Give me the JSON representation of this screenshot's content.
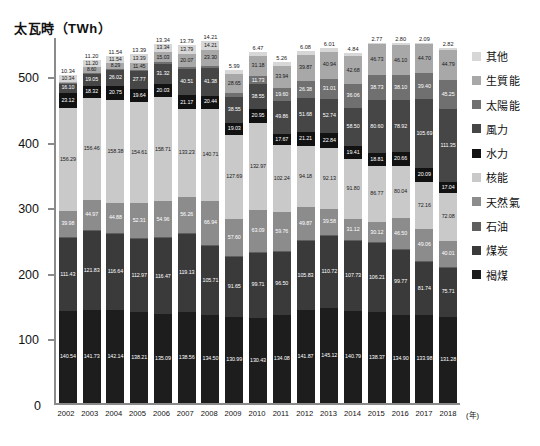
{
  "chart_data": {
    "type": "bar",
    "stacked": true,
    "title": "",
    "ylabel": "太瓦時（TWh）",
    "xlabel": "(年)",
    "ylim": [
      0,
      560
    ],
    "yticks": [
      0,
      100,
      200,
      300,
      400,
      500
    ],
    "ytick_labels": [
      "0",
      "100",
      "200",
      "300",
      "400",
      "500"
    ],
    "grid": false,
    "legend_position": "right",
    "categories": [
      "2002",
      "2003",
      "2004",
      "2005",
      "2006",
      "2007",
      "2008",
      "2009",
      "2010",
      "2011",
      "2012",
      "2013",
      "2014",
      "2015",
      "2016",
      "2017",
      "2018"
    ],
    "stack_order_bottom_to_top": [
      "褐煤",
      "煤炭",
      "石油",
      "天然氣",
      "核能",
      "水力",
      "風力",
      "太陽能",
      "生質能",
      "其他"
    ],
    "series": [
      {
        "name": "褐煤",
        "color": "#1d1d1d",
        "values": [
          140.54,
          141.73,
          142.14,
          138.21,
          135.09,
          138.56,
          134.5,
          130.99,
          130.43,
          134.08,
          141.87,
          145.12,
          140.79,
          138.37,
          134.9,
          133.98,
          131.28
        ]
      },
      {
        "name": "煤炭",
        "color": "#3a3a3a",
        "values": [
          111.43,
          121.83,
          116.64,
          112.97,
          116.47,
          119.13,
          105.71,
          91.65,
          99.71,
          96.5,
          105.83,
          110.72,
          107.73,
          106.21,
          99.77,
          81.74,
          75.71
        ]
      },
      {
        "name": "石油",
        "color": "#5f5f5f",
        "values": [
          1.32,
          1.15,
          0.91,
          1.27,
          1.24,
          1.03,
          0.99,
          1.01,
          1.05,
          0.99,
          0.99,
          0.97,
          0.9,
          0.95,
          0.91,
          0.91,
          1.0
        ]
      },
      {
        "name": "天然氣",
        "color": "#8c8c8c",
        "values": [
          39.98,
          44.97,
          44.88,
          52.31,
          54.96,
          56.26,
          66.94,
          57.6,
          63.09,
          59.76,
          49.87,
          39.58,
          31.12,
          30.12,
          46.5,
          49.06,
          40.01
        ]
      },
      {
        "name": "核能",
        "color": "#c9c9c9",
        "values": [
          156.29,
          156.46,
          158.38,
          154.61,
          158.71,
          133.23,
          140.71,
          127.69,
          132.97,
          102.24,
          94.18,
          92.13,
          91.8,
          86.77,
          80.04,
          72.16,
          72.08
        ]
      },
      {
        "name": "水力",
        "color": "#121212",
        "values": [
          23.12,
          18.32,
          20.75,
          19.64,
          20.03,
          21.17,
          20.44,
          19.03,
          20.95,
          17.67,
          21.21,
          22.84,
          19.41,
          18.81,
          20.66,
          20.09,
          17.04
        ]
      },
      {
        "name": "風力",
        "color": "#464646",
        "values": [
          16.1,
          19.05,
          26.02,
          27.77,
          31.32,
          40.51,
          41.38,
          38.55,
          38.55,
          49.86,
          51.68,
          52.74,
          58.5,
          80.6,
          78.92,
          105.69,
          111.35
        ]
      },
      {
        "name": "太陽能",
        "color": "#707070",
        "values": [
          0.16,
          0.51,
          0.56,
          1.28,
          2.22,
          3.08,
          4.42,
          6.58,
          11.73,
          19.6,
          26.38,
          31.01,
          36.06,
          38.73,
          38.1,
          39.4,
          45.25
        ]
      },
      {
        "name": "生質能",
        "color": "#a8a8a8",
        "values": [
          1.08,
          8.6,
          8.29,
          11.45,
          15.03,
          20.07,
          23.3,
          28.65,
          31.18,
          33.94,
          39.87,
          40.94,
          42.68,
          46.73,
          46.1,
          44.7,
          44.79
        ]
      },
      {
        "name": "其他",
        "color": "#d7d7d7",
        "values": [
          10.34,
          11.2,
          11.54,
          13.39,
          13.34,
          13.79,
          14.21,
          5.99,
          6.47,
          5.26,
          6.08,
          6.01,
          4.84,
          2.77,
          2.8,
          2.09,
          2.82
        ]
      }
    ],
    "total_labels": [
      "10.34",
      "11.20",
      "11.54",
      "13.39",
      "13.34",
      "13.79",
      "14.21",
      "5.99",
      "6.47",
      "5.26",
      "6.08",
      "6.01",
      "4.84",
      "2.77",
      "2.80",
      "2.09",
      "2.82"
    ]
  },
  "legend": {
    "items": [
      {
        "label": "其他",
        "color": "#d7d7d7"
      },
      {
        "label": "生質能",
        "color": "#a8a8a8"
      },
      {
        "label": "太陽能",
        "color": "#707070"
      },
      {
        "label": "風力",
        "color": "#464646"
      },
      {
        "label": "水力",
        "color": "#121212"
      },
      {
        "label": "核能",
        "color": "#c9c9c9"
      },
      {
        "label": "天然氣",
        "color": "#8c8c8c"
      },
      {
        "label": "石油",
        "color": "#5f5f5f"
      },
      {
        "label": "煤炭",
        "color": "#3a3a3a"
      },
      {
        "label": "褐煤",
        "color": "#1d1d1d"
      }
    ]
  },
  "axes": {
    "y_title": "太瓦時（TWh）",
    "x_unit": "(年)",
    "zero_label": "0"
  }
}
